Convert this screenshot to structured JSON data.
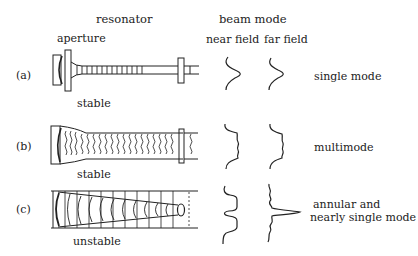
{
  "headers": {
    "resonator": "resonator",
    "beam_mode": "beam mode",
    "near_field": "near field",
    "far_field": "far field"
  },
  "rows": [
    {
      "id": "a",
      "label": "(a)",
      "resonator_type": "stable",
      "extra_label": "aperture",
      "mode_description": "single mode",
      "near_field_profile": "gaussian",
      "far_field_profile": "gaussian"
    },
    {
      "id": "b",
      "label": "(b)",
      "resonator_type": "stable",
      "mode_description": "multimode",
      "near_field_profile": "flat-top with ripples",
      "far_field_profile": "broad with ripples"
    },
    {
      "id": "c",
      "label": "(c)",
      "resonator_type": "unstable",
      "mode_description_line1": "annular and",
      "mode_description_line2": "nearly single mode",
      "near_field_profile": "annular (two lobes)",
      "far_field_profile": "sharp central peak with side lobes"
    }
  ],
  "colors": {
    "ink": "#222222",
    "background": "#ffffff"
  }
}
